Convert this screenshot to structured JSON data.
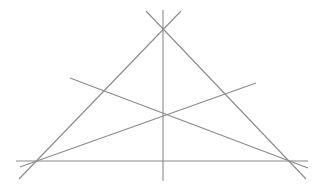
{
  "diagram": {
    "stroke_color": "#8a8a8a",
    "background": "#ffffff",
    "points": {
      "apex": [
        163,
        30
      ],
      "left_vertex": [
        36,
        161
      ],
      "right_vertex": [
        290,
        161
      ],
      "interior": [
        163,
        118
      ]
    },
    "lines": [
      {
        "name": "left-side",
        "x1": 181,
        "y1": 11,
        "x2": 19,
        "y2": 179
      },
      {
        "name": "right-side",
        "x1": 146,
        "y1": 11,
        "x2": 306,
        "y2": 179
      },
      {
        "name": "vertical-altitude",
        "x1": 163,
        "y1": 10,
        "x2": 163,
        "y2": 181
      },
      {
        "name": "base-line",
        "x1": 16,
        "y1": 161,
        "x2": 308,
        "y2": 161
      },
      {
        "name": "cevian-to-right-vertex",
        "x1": 70,
        "y1": 78,
        "x2": 308,
        "y2": 168
      },
      {
        "name": "cevian-to-left-vertex",
        "x1": 256,
        "y1": 83,
        "x2": 20,
        "y2": 167
      }
    ]
  }
}
